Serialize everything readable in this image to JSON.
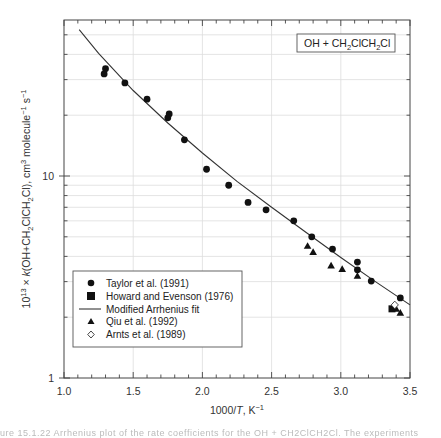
{
  "chart_data": {
    "type": "scatter",
    "title": "",
    "annotation": "OH + CH2ClCH2Cl",
    "xlabel": "1000/T, K^-1",
    "ylabel": "10^13 × k(OH+CH2ClCH2Cl), cm^3 molecule^-1 s^-1",
    "xlim": [
      1.0,
      3.5
    ],
    "ylim": [
      1,
      59
    ],
    "yscale": "log",
    "grid": true,
    "x_ticks": [
      "1.0",
      "1.5",
      "2.0",
      "2.5",
      "3.0",
      "3.5"
    ],
    "y_ticks": [
      "1",
      "10"
    ],
    "legend_position": "lower left",
    "series": [
      {
        "name": "Taylor et al. (1991)",
        "marker": "circle-filled",
        "points": [
          [
            1.29,
            32.0
          ],
          [
            1.3,
            34.0
          ],
          [
            1.44,
            28.9
          ],
          [
            1.6,
            24.0
          ],
          [
            1.75,
            19.4
          ],
          [
            1.76,
            20.3
          ],
          [
            1.87,
            15.1
          ],
          [
            2.03,
            10.8
          ],
          [
            2.19,
            9.0
          ],
          [
            2.33,
            7.4
          ],
          [
            2.46,
            6.8
          ],
          [
            2.66,
            6.0
          ],
          [
            2.79,
            5.0
          ],
          [
            2.94,
            4.35
          ],
          [
            3.12,
            3.75
          ],
          [
            3.12,
            3.43
          ],
          [
            3.22,
            3.02
          ],
          [
            3.43,
            2.49
          ]
        ]
      },
      {
        "name": "Howard and Evenson (1976)",
        "marker": "square-filled",
        "points": [
          [
            3.37,
            2.2
          ]
        ]
      },
      {
        "name": "Modified Arrhenius fit",
        "marker": "line",
        "points": [
          [
            1.11,
            53.0
          ],
          [
            1.25,
            40.5
          ],
          [
            1.5,
            26.5
          ],
          [
            1.75,
            18.3
          ],
          [
            2.0,
            13.0
          ],
          [
            2.25,
            9.4
          ],
          [
            2.5,
            7.0
          ],
          [
            2.75,
            5.25
          ],
          [
            3.0,
            3.95
          ],
          [
            3.25,
            3.0
          ],
          [
            3.5,
            2.3
          ]
        ]
      },
      {
        "name": "Qiu et al. (1992)",
        "marker": "triangle-filled",
        "points": [
          [
            2.76,
            4.5
          ],
          [
            2.8,
            4.2
          ],
          [
            2.93,
            3.6
          ],
          [
            3.01,
            3.46
          ],
          [
            3.12,
            3.2
          ],
          [
            3.4,
            2.2
          ],
          [
            3.43,
            2.1
          ]
        ]
      },
      {
        "name": "Arnts et al. (1989)",
        "marker": "diamond-open",
        "points": [
          [
            3.39,
            2.3
          ]
        ]
      }
    ]
  },
  "labels": {
    "annotation_main": "OH + CH",
    "annotation_sub1": "2",
    "annotation_mid": "ClCH",
    "annotation_sub2": "2",
    "annotation_end": "Cl",
    "x_tick_1": "1.0",
    "x_tick_2": "1.5",
    "x_tick_3": "2.0",
    "x_tick_4": "2.5",
    "x_tick_5": "3.0",
    "x_tick_6": "3.5",
    "y_tick_1": "1",
    "y_tick_10": "10",
    "xlabel_main": "1000/",
    "xlabel_T": "T",
    "xlabel_unit": ", K",
    "xlabel_exp": "−1",
    "ylabel_a": "10",
    "ylabel_a_exp": "13",
    "ylabel_b": " × ",
    "ylabel_k": "k",
    "ylabel_c": "(OH+CH",
    "ylabel_c_sub": "2",
    "ylabel_d": "ClCH",
    "ylabel_d_sub": "2",
    "ylabel_e": "Cl), cm",
    "ylabel_e_exp": "3",
    "ylabel_f": " molecule",
    "ylabel_f_exp": "−1",
    "ylabel_g": " s",
    "ylabel_g_exp": "−1",
    "legend": [
      "Taylor et al. (1991)",
      "Howard and Evenson (1976)",
      "Modified Arrhenius fit",
      "Qiu et al. (1992)",
      "Arnts et al. (1989)"
    ],
    "caption": "ure 15.1.22  Arrhenius plot of the rate coefficients for the OH + CH2ClCH2Cl. The experiments"
  }
}
